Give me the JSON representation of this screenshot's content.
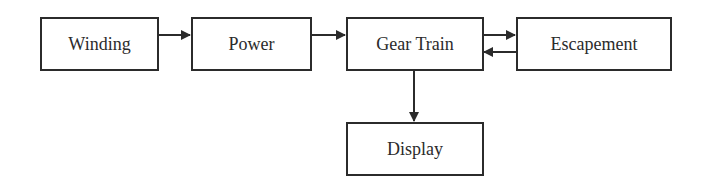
{
  "diagram": {
    "type": "block-flow",
    "nodes": [
      {
        "id": "winding",
        "label": "Winding"
      },
      {
        "id": "power",
        "label": "Power"
      },
      {
        "id": "gear_train",
        "label": "Gear Train"
      },
      {
        "id": "escapement",
        "label": "Escapement"
      },
      {
        "id": "display",
        "label": "Display"
      }
    ],
    "edges": [
      {
        "from": "winding",
        "to": "power"
      },
      {
        "from": "power",
        "to": "gear_train"
      },
      {
        "from": "gear_train",
        "to": "escapement"
      },
      {
        "from": "escapement",
        "to": "gear_train"
      },
      {
        "from": "gear_train",
        "to": "display"
      }
    ],
    "colors": {
      "stroke": "#2b2b2b",
      "background": "#ffffff"
    }
  }
}
